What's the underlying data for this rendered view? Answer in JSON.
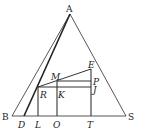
{
  "diagram": {
    "type": "geometry",
    "stroke_color": "#333333",
    "background": "#ffffff",
    "points": {
      "A": {
        "label": "A",
        "x": 70,
        "y": 14,
        "italic": false
      },
      "B": {
        "label": "B",
        "x": 12,
        "y": 116,
        "italic": false
      },
      "S": {
        "label": "S",
        "x": 126,
        "y": 116,
        "italic": false
      },
      "D": {
        "label": "D",
        "x": 24,
        "y": 116,
        "italic": true
      },
      "L": {
        "label": "L",
        "x": 38,
        "y": 116,
        "italic": true
      },
      "O": {
        "label": "O",
        "x": 57,
        "y": 116,
        "italic": true
      },
      "T": {
        "label": "T",
        "x": 91,
        "y": 116,
        "italic": true
      },
      "R": {
        "label": "R",
        "x": 38,
        "y": 87,
        "italic": true
      },
      "K": {
        "label": "K",
        "x": 57,
        "y": 87,
        "italic": true
      },
      "J": {
        "label": "J",
        "x": 91,
        "y": 87,
        "italic": true
      },
      "M": {
        "label": "M",
        "x": 57,
        "y": 81,
        "italic": true
      },
      "P": {
        "label": "P",
        "x": 91,
        "y": 81,
        "italic": true
      },
      "E": {
        "label": "E",
        "x": 91,
        "y": 69,
        "italic": true
      }
    },
    "segments": [
      [
        "A",
        "B"
      ],
      [
        "A",
        "S"
      ],
      [
        "B",
        "S"
      ],
      [
        "A",
        "D"
      ],
      [
        "R",
        "L"
      ],
      [
        "M",
        "O"
      ],
      [
        "E",
        "T"
      ],
      [
        "R",
        "E"
      ],
      [
        "M",
        "P"
      ],
      [
        "R",
        "J"
      ]
    ]
  }
}
